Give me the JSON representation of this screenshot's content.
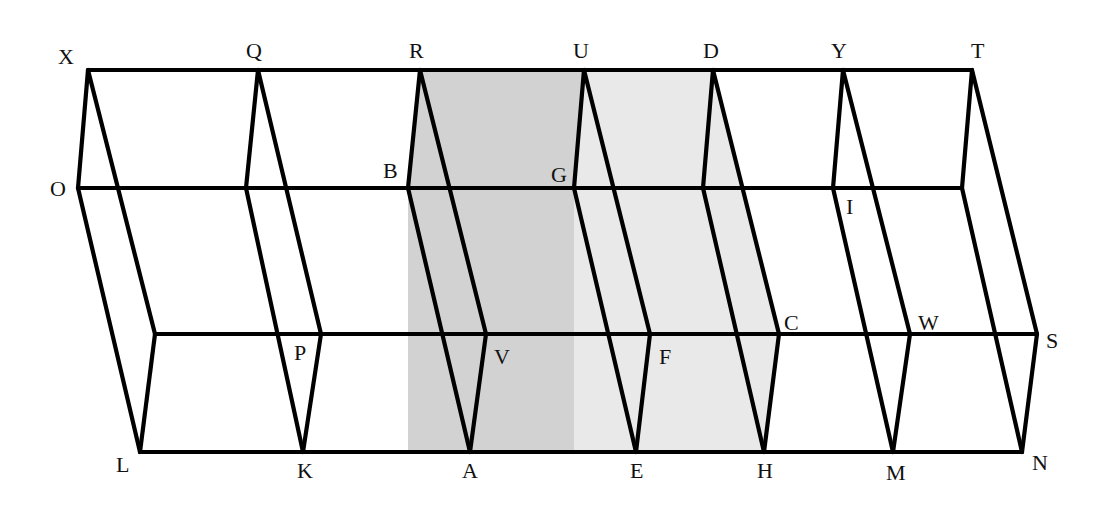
{
  "figure": {
    "colors": {
      "stroke": "#000000",
      "shade_dark": "#d2d2d2",
      "shade_light": "#e9e9e9",
      "background": "#ffffff"
    },
    "lines": {
      "top_y": 70,
      "mid_y": 188,
      "lower_y": 334,
      "bottom_y": 452
    },
    "slices": [
      {
        "top": "X",
        "top_x": 88,
        "mid": "O",
        "mid_x": 78,
        "lower": "",
        "lower_x": 155,
        "bottom": "L",
        "bottom_x": 140
      },
      {
        "top": "Q",
        "top_x": 258,
        "mid": "",
        "mid_x": 246,
        "lower": "P",
        "lower_x": 321,
        "bottom": "K",
        "bottom_x": 303
      },
      {
        "top": "R",
        "top_x": 420,
        "mid": "B",
        "mid_x": 408,
        "lower": "V",
        "lower_x": 486,
        "bottom": "A",
        "bottom_x": 470
      },
      {
        "top": "U",
        "top_x": 584,
        "mid": "G",
        "mid_x": 574,
        "lower": "F",
        "lower_x": 650,
        "bottom": "E",
        "bottom_x": 636
      },
      {
        "top": "D",
        "top_x": 713,
        "mid": "",
        "mid_x": 703,
        "lower": "C",
        "lower_x": 779,
        "bottom": "H",
        "bottom_x": 764
      },
      {
        "top": "Y",
        "top_x": 843,
        "mid": "I",
        "mid_x": 833,
        "lower": "W",
        "lower_x": 910,
        "bottom": "M",
        "bottom_x": 893
      },
      {
        "top": "T",
        "top_x": 972,
        "mid": "",
        "mid_x": 962,
        "lower": "S",
        "lower_x": 1037,
        "bottom": "N",
        "bottom_x": 1022
      }
    ],
    "shaded_regions": [
      {
        "name": "plane-RUEA",
        "tone": "dark",
        "from_slice": 2,
        "to_slice": 3
      },
      {
        "name": "plane-UDHE",
        "tone": "light",
        "from_slice": 3,
        "to_slice": 4
      }
    ],
    "labels": [
      {
        "text": "X",
        "x": 58,
        "y": 64
      },
      {
        "text": "Q",
        "x": 246,
        "y": 58
      },
      {
        "text": "R",
        "x": 409,
        "y": 58
      },
      {
        "text": "U",
        "x": 573,
        "y": 58
      },
      {
        "text": "D",
        "x": 703,
        "y": 58
      },
      {
        "text": "Y",
        "x": 831,
        "y": 58
      },
      {
        "text": "T",
        "x": 971,
        "y": 58
      },
      {
        "text": "O",
        "x": 50,
        "y": 196
      },
      {
        "text": "B",
        "x": 383,
        "y": 178
      },
      {
        "text": "G",
        "x": 551,
        "y": 182
      },
      {
        "text": "I",
        "x": 846,
        "y": 214
      },
      {
        "text": "P",
        "x": 294,
        "y": 360
      },
      {
        "text": "V",
        "x": 494,
        "y": 364
      },
      {
        "text": "F",
        "x": 659,
        "y": 364
      },
      {
        "text": "C",
        "x": 784,
        "y": 330
      },
      {
        "text": "W",
        "x": 918,
        "y": 330
      },
      {
        "text": "S",
        "x": 1046,
        "y": 348
      },
      {
        "text": "L",
        "x": 116,
        "y": 472
      },
      {
        "text": "K",
        "x": 297,
        "y": 478
      },
      {
        "text": "A",
        "x": 462,
        "y": 478
      },
      {
        "text": "E",
        "x": 630,
        "y": 478
      },
      {
        "text": "H",
        "x": 757,
        "y": 478
      },
      {
        "text": "M",
        "x": 886,
        "y": 480
      },
      {
        "text": "N",
        "x": 1032,
        "y": 470
      }
    ]
  }
}
